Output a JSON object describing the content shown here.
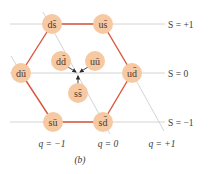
{
  "figure": {
    "caption": "(b)",
    "colors": {
      "node_fill": "#f6c9a3",
      "node_edge": "#f3d8c0",
      "hexagon_edge": "#d9553a",
      "grid_line": "#c9c9c9",
      "arrow": "#2b2b2b",
      "text": "#3a3a3a"
    },
    "strangeness_lines": [
      {
        "label": "S = +1",
        "y": 24
      },
      {
        "label": "S = 0",
        "y": 73
      },
      {
        "label": "S = −1",
        "y": 122
      }
    ],
    "charge_lines": [
      {
        "label": "q = −1",
        "label_x": 52
      },
      {
        "label": "q = 0",
        "label_x": 108
      },
      {
        "label": "q = +1",
        "label_x": 162
      }
    ],
    "nodes": [
      {
        "id": "ds",
        "label": "ds̄",
        "x": 52,
        "y": 24,
        "ring": "outer"
      },
      {
        "id": "us",
        "label": "us̄",
        "x": 103,
        "y": 24,
        "ring": "outer"
      },
      {
        "id": "du",
        "label": "dū",
        "x": 21,
        "y": 73,
        "ring": "outer"
      },
      {
        "id": "ud",
        "label": "ud̄",
        "x": 132,
        "y": 73,
        "ring": "outer"
      },
      {
        "id": "su",
        "label": "sū",
        "x": 53,
        "y": 122,
        "ring": "outer"
      },
      {
        "id": "sd",
        "label": "sd̄",
        "x": 103,
        "y": 122,
        "ring": "outer"
      },
      {
        "id": "dd",
        "label": "dd̄",
        "x": 61,
        "y": 61,
        "ring": "center"
      },
      {
        "id": "uu",
        "label": "uū",
        "x": 95,
        "y": 61,
        "ring": "center"
      },
      {
        "id": "ss",
        "label": "ss̄",
        "x": 78,
        "y": 93,
        "ring": "center"
      }
    ]
  }
}
